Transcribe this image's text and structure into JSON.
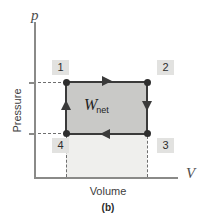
{
  "figure": {
    "caption": "(b)",
    "axes": {
      "y_symbol": "p",
      "x_symbol": "V",
      "y_name": "Pressure",
      "x_name": "Volume"
    },
    "annotations": {
      "work_symbol": "W",
      "work_subscript": "net"
    },
    "state_tags": [
      {
        "id": "1",
        "label": "1"
      },
      {
        "id": "2",
        "label": "2"
      },
      {
        "id": "3",
        "label": "3"
      },
      {
        "id": "4",
        "label": "4"
      }
    ],
    "colors": {
      "cycle_fill": "#c9c9c7",
      "lower_fill": "#efefed",
      "path_stroke": "#3a3a3a",
      "axis_stroke": "#8a8a88",
      "tag_background": "#e2e2e0",
      "guide_dash": "#6f6f6f"
    }
  },
  "chart_data": {
    "type": "line",
    "title": "",
    "subtitle": "(b)",
    "xlabel": "Volume",
    "ylabel": "Pressure",
    "x_axis_symbol": "V",
    "y_axis_symbol": "p",
    "grid": false,
    "legend": null,
    "xlim": [
      0,
      1
    ],
    "ylim": [
      0,
      1
    ],
    "series": [
      {
        "name": "Rectangular thermodynamic cycle",
        "closed": true,
        "direction": "clockwise",
        "points": [
          {
            "state": "1",
            "x": 0.28,
            "y": 0.61,
            "label_position": "above-left"
          },
          {
            "state": "2",
            "x": 0.8,
            "y": 0.61,
            "label_position": "above-right"
          },
          {
            "state": "3",
            "x": 0.8,
            "y": 0.28,
            "label_position": "below-right"
          },
          {
            "state": "4",
            "x": 0.28,
            "y": 0.28,
            "label_position": "below-left"
          }
        ],
        "process_arrows": [
          {
            "from": "1",
            "to": "2",
            "direction": "right",
            "description": "isobaric expansion"
          },
          {
            "from": "2",
            "to": "3",
            "direction": "down",
            "description": "isochoric pressure drop"
          },
          {
            "from": "3",
            "to": "4",
            "direction": "left",
            "description": "isobaric compression"
          },
          {
            "from": "4",
            "to": "1",
            "direction": "up",
            "description": "isochoric pressure rise"
          }
        ]
      }
    ],
    "shaded_regions": [
      {
        "name": "net work area",
        "label": "W_net",
        "fill": "#c9c9c7",
        "bounds": {
          "x": [
            0.28,
            0.8
          ],
          "y": [
            0.28,
            0.61
          ]
        }
      },
      {
        "name": "lower area",
        "label": "",
        "fill": "#efefed",
        "bounds": {
          "x": [
            0.28,
            0.8
          ],
          "y": [
            0.0,
            0.28
          ]
        }
      }
    ],
    "guides": [
      {
        "type": "horizontal-dashed",
        "y": 0.61,
        "from_axis": true
      },
      {
        "type": "horizontal-dashed",
        "y": 0.28,
        "from_axis": true
      },
      {
        "type": "vertical-dashed",
        "x": 0.28,
        "to_axis": true
      },
      {
        "type": "vertical-dashed",
        "x": 0.8,
        "to_axis": true
      }
    ],
    "ticks": {
      "y": [
        0.28,
        0.61
      ],
      "x": []
    }
  }
}
